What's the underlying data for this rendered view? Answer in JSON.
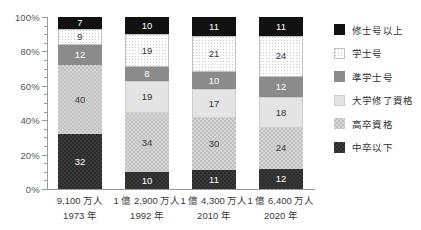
{
  "chart_data": {
    "type": "bar",
    "title": "",
    "xlabel": "",
    "ylabel": "",
    "ylim": [
      0,
      100
    ],
    "y_ticks": [
      "0%",
      "20%",
      "40%",
      "60%",
      "80%",
      "100%"
    ],
    "y_tick_values": [
      0,
      20,
      40,
      60,
      80,
      100
    ],
    "minor_tick_step": 5,
    "grid": false,
    "stacked": true,
    "normalized_percent": true,
    "legend_position": "right",
    "categories": [
      "1973 年",
      "1992 年",
      "2010 年",
      "2020 年"
    ],
    "category_sublabels": [
      "9,100 万人",
      "1 億 2,900 万人",
      "1 億 4,300 万人",
      "1 億 6,400 万人"
    ],
    "series": [
      {
        "name": "修士号以上",
        "key": "master",
        "color": "#111111",
        "values": [
          7,
          10,
          11,
          11
        ]
      },
      {
        "name": "学士号",
        "key": "bachelor",
        "color": "#ffffff",
        "values": [
          9,
          19,
          21,
          24
        ]
      },
      {
        "name": "準学士号",
        "key": "associate",
        "color": "#8b8b8b",
        "values": [
          12,
          8,
          10,
          12
        ]
      },
      {
        "name": "大学修了資格",
        "key": "college",
        "color": "#e4e4e4",
        "values": [
          0,
          19,
          17,
          18
        ]
      },
      {
        "name": "高卒資格",
        "key": "highschool",
        "color": "#d6d6d6",
        "values": [
          40,
          34,
          30,
          24
        ]
      },
      {
        "name": "中卒以下",
        "key": "below",
        "color": "#3b3b3b",
        "values": [
          32,
          10,
          11,
          12
        ]
      }
    ]
  },
  "axis": {
    "y_labels": [
      "100%",
      "80%",
      "60%",
      "40%",
      "20%",
      "0%"
    ]
  },
  "x_axis": {
    "groups": [
      {
        "population": "9,100 万人",
        "year": "1973 年"
      },
      {
        "population": "1 億 2,900 万人",
        "year": "1992 年"
      },
      {
        "population": "1 億 4,300 万人",
        "year": "2010 年"
      },
      {
        "population": "1 億 6,400 万人",
        "year": "2020 年"
      }
    ]
  },
  "legend": {
    "items": [
      {
        "label": "修士号以上",
        "swatch": "swatch-master"
      },
      {
        "label": "学士号",
        "swatch": "swatch-bachelor"
      },
      {
        "label": "準学士号",
        "swatch": "swatch-associate"
      },
      {
        "label": "大学修了資格",
        "swatch": "swatch-college"
      },
      {
        "label": "高卒資格",
        "swatch": "swatch-highschool"
      },
      {
        "label": "中卒以下",
        "swatch": "swatch-below"
      }
    ]
  },
  "bar_labels": {
    "b0": [
      "7",
      "9",
      "12",
      "",
      "40",
      "32"
    ],
    "b1": [
      "10",
      "19",
      "8",
      "19",
      "34",
      "10"
    ],
    "b2": [
      "11",
      "21",
      "10",
      "17",
      "30",
      "11"
    ],
    "b3": [
      "11",
      "24",
      "12",
      "18",
      "24",
      "12"
    ]
  }
}
